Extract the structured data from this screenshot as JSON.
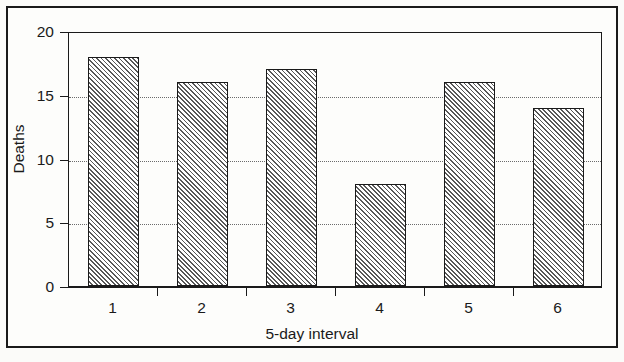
{
  "chart_data": {
    "type": "bar",
    "title": "",
    "subtitle": "",
    "xlabel": "5-day interval",
    "ylabel": "Deaths",
    "categories": [
      "1",
      "2",
      "3",
      "4",
      "5",
      "6"
    ],
    "values": [
      18,
      16,
      17,
      8,
      16,
      14
    ],
    "series": [
      {
        "name": "Deaths",
        "values": [
          18,
          16,
          17,
          8,
          16,
          14
        ]
      }
    ],
    "ylim": [
      0,
      20
    ],
    "y_ticks": [
      0,
      5,
      10,
      15,
      20
    ],
    "y_tick_labels": [
      "0",
      "5",
      "10",
      "15",
      "20"
    ],
    "x_tick_labels": [
      "1",
      "2",
      "3",
      "4",
      "5",
      "6"
    ],
    "gridlines": {
      "horizontal": [
        5,
        10,
        15
      ],
      "style": "dotted",
      "vertical": []
    },
    "legend": {
      "visible": false,
      "position": "none",
      "entries": []
    },
    "annotations": [],
    "bar_style": {
      "fill": "diagonal-hatch",
      "fill_color": "#ffffff",
      "hatch_color": "#585858",
      "edge_color": "#1a1a1a"
    },
    "colors": {
      "axis": "#1a1a1a",
      "grid": "#6b6b6b",
      "text": "#1a1a1a",
      "background": "#fdfdfb",
      "frame": "#1a1a1a"
    }
  }
}
